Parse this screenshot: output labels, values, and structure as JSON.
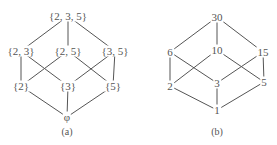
{
  "diagrams": [
    {
      "caption": "(a)",
      "nodes": [
        {
          "id": "n235",
          "label": "{2, 3, 5}",
          "x": 68,
          "y": 16
        },
        {
          "id": "n23",
          "label": "{2, 3}",
          "x": 21,
          "y": 51
        },
        {
          "id": "n25",
          "label": "{2, 5}",
          "x": 68,
          "y": 51
        },
        {
          "id": "n35",
          "label": "{3, 5}",
          "x": 115,
          "y": 51
        },
        {
          "id": "n2",
          "label": "{2}",
          "x": 21,
          "y": 86
        },
        {
          "id": "n3",
          "label": "{3}",
          "x": 68,
          "y": 86
        },
        {
          "id": "n5",
          "label": "{5}",
          "x": 113,
          "y": 86
        },
        {
          "id": "empty",
          "label": "φ",
          "x": 67,
          "y": 117
        }
      ],
      "edges": [
        [
          "n235",
          "n23"
        ],
        [
          "n235",
          "n25"
        ],
        [
          "n235",
          "n35"
        ],
        [
          "n23",
          "n2"
        ],
        [
          "n23",
          "n3"
        ],
        [
          "n25",
          "n2"
        ],
        [
          "n25",
          "n5"
        ],
        [
          "n35",
          "n3"
        ],
        [
          "n35",
          "n5"
        ],
        [
          "n2",
          "empty"
        ],
        [
          "n3",
          "empty"
        ],
        [
          "n5",
          "empty"
        ]
      ]
    },
    {
      "caption": "(b)",
      "nodes": [
        {
          "id": "d30",
          "label": "30",
          "x": 217,
          "y": 17
        },
        {
          "id": "d6",
          "label": "6",
          "x": 170,
          "y": 52
        },
        {
          "id": "d10",
          "label": "10",
          "x": 217,
          "y": 50
        },
        {
          "id": "d15",
          "label": "15",
          "x": 263,
          "y": 52
        },
        {
          "id": "d2",
          "label": "2",
          "x": 170,
          "y": 86
        },
        {
          "id": "d3",
          "label": "3",
          "x": 217,
          "y": 83
        },
        {
          "id": "d5",
          "label": "5",
          "x": 264,
          "y": 82
        },
        {
          "id": "d1",
          "label": "1",
          "x": 217,
          "y": 110
        }
      ],
      "edges": [
        [
          "d30",
          "d6"
        ],
        [
          "d30",
          "d10"
        ],
        [
          "d30",
          "d15"
        ],
        [
          "d6",
          "d2"
        ],
        [
          "d6",
          "d3"
        ],
        [
          "d10",
          "d2"
        ],
        [
          "d10",
          "d5"
        ],
        [
          "d15",
          "d3"
        ],
        [
          "d15",
          "d5"
        ],
        [
          "d2",
          "d1"
        ],
        [
          "d3",
          "d1"
        ],
        [
          "d5",
          "d1"
        ]
      ]
    }
  ],
  "captions": {
    "a": "(a)",
    "b": "(b)"
  },
  "colors": {
    "line": "#555555",
    "text": "#555555",
    "background": "#ffffff"
  }
}
